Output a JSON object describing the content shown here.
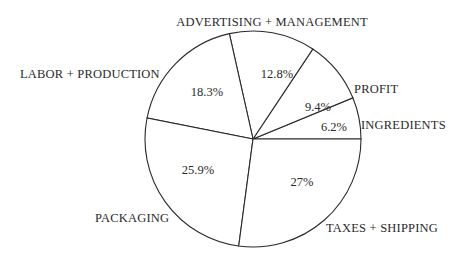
{
  "chart_data": {
    "type": "pie",
    "title": "",
    "center": [
      253,
      139
    ],
    "radius": 108,
    "start_angle_deg": 0,
    "direction": "counterclockwise-from-3-oclock",
    "slices": [
      {
        "name": "INGREDIENTS",
        "value": 6.2,
        "pct_label": "6.2%",
        "label_pos": [
          361,
          129
        ],
        "pct_pos": [
          334,
          131
        ],
        "label_anchor": "start"
      },
      {
        "name": "PROFIT",
        "value": 9.4,
        "pct_label": "9.4%",
        "label_pos": [
          354,
          93
        ],
        "pct_pos": [
          318,
          111
        ],
        "label_anchor": "start"
      },
      {
        "name": "ADVERTISING + MANAGEMENT",
        "value": 12.8,
        "pct_label": "12.8%",
        "label_pos": [
          272,
          26
        ],
        "pct_pos": [
          277,
          78
        ],
        "label_anchor": "middle"
      },
      {
        "name": "LABOR + PRODUCTION",
        "value": 18.3,
        "pct_label": "18.3%",
        "label_pos": [
          20,
          78
        ],
        "pct_pos": [
          207,
          96
        ],
        "label_anchor": "start"
      },
      {
        "name": "PACKAGING",
        "value": 25.9,
        "pct_label": "25.9%",
        "label_pos": [
          95,
          222
        ],
        "pct_pos": [
          198,
          174
        ],
        "label_anchor": "start"
      },
      {
        "name": "TAXES + SHIPPING",
        "value": 27,
        "pct_label": "27%",
        "label_pos": [
          326,
          232
        ],
        "pct_pos": [
          302,
          186
        ],
        "label_anchor": "start"
      }
    ],
    "legend": "none (direct labels)",
    "grid": false
  }
}
